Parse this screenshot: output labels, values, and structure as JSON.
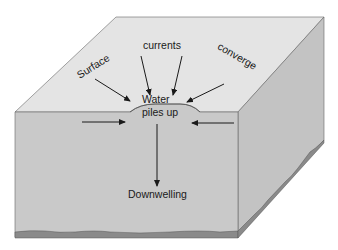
{
  "diagram": {
    "labels": {
      "surface": "Surface",
      "currents": "currents",
      "converge": "converge",
      "water": "Water",
      "piles_up": "piles up",
      "downwelling": "Downwelling"
    },
    "colors": {
      "top_face": "#e4e4e4",
      "front_face": "#c9c9c9",
      "side_face": "#c3c3c3",
      "seabed": "#8a8a8a",
      "edge": "#555555",
      "arrow": "#1a1a1a"
    }
  }
}
